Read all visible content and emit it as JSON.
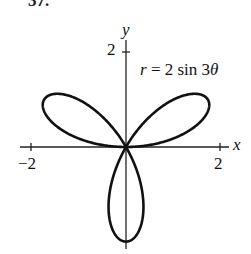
{
  "header": {
    "cut_label": "37."
  },
  "chart_data": {
    "type": "line",
    "subtype": "polar-rose",
    "title": "",
    "equation": {
      "r": "r",
      "eq": "= 2 sin 3",
      "theta": "θ"
    },
    "xlabel": "x",
    "ylabel": "y",
    "xlim": [
      -2.2,
      2.2
    ],
    "ylim": [
      -2.1,
      2.1
    ],
    "x_ticks": [
      {
        "value": -2,
        "label": "−2"
      },
      {
        "value": 2,
        "label": "2"
      }
    ],
    "y_ticks": [
      {
        "value": 2,
        "label": "2"
      }
    ],
    "grid": false,
    "legend": "none",
    "series": [
      {
        "name": "r = 2 sin 3θ",
        "a": 2,
        "k": 3,
        "petals": 3,
        "petal_directions_deg": [
          30,
          150,
          270
        ],
        "color": "#111111"
      }
    ]
  }
}
